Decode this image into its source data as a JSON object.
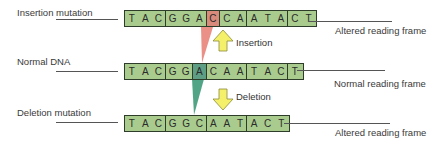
{
  "figure": {
    "colors": {
      "base_fill": "#a9cc8e",
      "border": "#2d3d2a",
      "inserted_base": "#d98a7a",
      "deleted_base": "#5e9e84",
      "insertion_wedge": "#e8847a",
      "deletion_wedge": "#3f9a7a",
      "arrow_fill": "#f4f06a",
      "arrow_stroke": "#8a8a3a"
    }
  },
  "rows": {
    "insertion": {
      "label": "Insertion mutation",
      "sequence": [
        "T",
        "A",
        "C",
        "G",
        "G",
        "A",
        "C",
        "C",
        "A",
        "A",
        "T",
        "A",
        "C",
        "T"
      ],
      "inserted_index": 6,
      "frame_label": "Altered reading frame"
    },
    "normal": {
      "label": "Normal DNA",
      "sequence": [
        "T",
        "A",
        "C",
        "G",
        "G",
        "A",
        "C",
        "A",
        "A",
        "T",
        "A",
        "C",
        "T"
      ],
      "highlight_index": 5,
      "frame_label": "Normal reading frame"
    },
    "deletion": {
      "label": "Deletion mutation",
      "sequence": [
        "T",
        "A",
        "C",
        "G",
        "G",
        "C",
        "A",
        "A",
        "T",
        "A",
        "C",
        "T"
      ],
      "frame_label": "Altered reading frame"
    }
  },
  "arrows": {
    "insertion": {
      "label": "Insertion",
      "direction": "up"
    },
    "deletion": {
      "label": "Deletion",
      "direction": "down"
    }
  }
}
